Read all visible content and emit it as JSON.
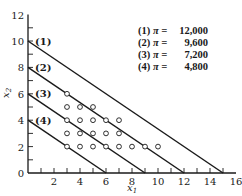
{
  "chart_data": {
    "type": "line",
    "title": "",
    "xlabel": "x1",
    "ylabel": "x2",
    "xlim": [
      0,
      16
    ],
    "ylim": [
      0,
      12
    ],
    "x_ticks": [
      2,
      4,
      6,
      8,
      10,
      12,
      14,
      16
    ],
    "y_ticks": [
      0,
      2,
      4,
      6,
      8,
      10,
      12
    ],
    "grid": false,
    "legend_position": "upper right",
    "series": [
      {
        "name": "(1) π = 12,000",
        "label": "(1)",
        "pi": "12,000",
        "points": [
          [
            0,
            10
          ],
          [
            15,
            0
          ]
        ]
      },
      {
        "name": "(2) π = 9,600",
        "label": "(2)",
        "pi": "9,600",
        "points": [
          [
            0,
            8
          ],
          [
            12,
            0
          ]
        ]
      },
      {
        "name": "(3) π = 7,200",
        "label": "(3)",
        "pi": "7,200",
        "points": [
          [
            0,
            6
          ],
          [
            9,
            0
          ]
        ]
      },
      {
        "name": "(4) π = 4,800",
        "label": "(4)",
        "pi": "4,800",
        "points": [
          [
            0,
            4
          ],
          [
            6,
            0
          ]
        ]
      }
    ],
    "scatter": {
      "name": "integer points",
      "marker": "open-circle",
      "points": [
        [
          3,
          6
        ],
        [
          3,
          5
        ],
        [
          4,
          5
        ],
        [
          5,
          5
        ],
        [
          3,
          4
        ],
        [
          4,
          4
        ],
        [
          5,
          4
        ],
        [
          6,
          4
        ],
        [
          7,
          4
        ],
        [
          3,
          3
        ],
        [
          4,
          3
        ],
        [
          5,
          3
        ],
        [
          6,
          3
        ],
        [
          7,
          3
        ],
        [
          3,
          2
        ],
        [
          4,
          2
        ],
        [
          5,
          2
        ],
        [
          6,
          2
        ],
        [
          7,
          2
        ],
        [
          8,
          2
        ],
        [
          9,
          2
        ],
        [
          10,
          2
        ]
      ]
    }
  },
  "legend": {
    "symbol": "π =",
    "items": [
      {
        "num": "(1)",
        "value": "12,000"
      },
      {
        "num": "(2)",
        "value": "9,600"
      },
      {
        "num": "(3)",
        "value": "7,200"
      },
      {
        "num": "(4)",
        "value": "4,800"
      }
    ]
  },
  "axes": {
    "x_label": "x",
    "x_label_sub": "1",
    "y_label": "x",
    "y_label_sub": "2"
  },
  "colors": {
    "line": "#1a1a1a",
    "background": "#ffffff"
  }
}
